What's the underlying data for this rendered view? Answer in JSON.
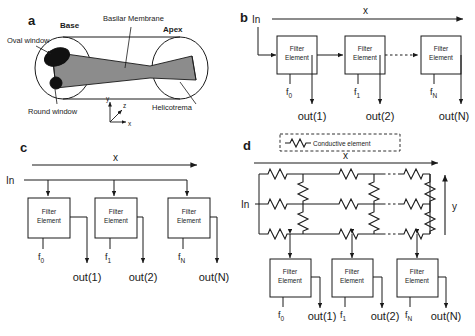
{
  "figure": {
    "panels": [
      "a",
      "b",
      "c",
      "d"
    ]
  },
  "panel_a": {
    "letter": "a",
    "labels": {
      "oval_window": "Oval window",
      "base": "Base",
      "basilar_membrane": "Basilar Membrane",
      "apex": "Apex",
      "round_window": "Round window",
      "helicotrema": "Helicotrema"
    },
    "axes": {
      "x": "x",
      "y": "y",
      "z": "z"
    }
  },
  "panel_b": {
    "letter": "b",
    "input": "In",
    "axis_label": "x",
    "filters": [
      {
        "box": [
          "Filter",
          "Element"
        ],
        "freq": "f",
        "freq_sub": "0",
        "out": "out(1)"
      },
      {
        "box": [
          "Filter",
          "Element"
        ],
        "freq": "f",
        "freq_sub": "1",
        "out": "out(2)"
      },
      {
        "box": [
          "Filter",
          "Element"
        ],
        "freq": "f",
        "freq_sub": "N",
        "out": "out(N)"
      }
    ]
  },
  "panel_c": {
    "letter": "c",
    "input": "In",
    "axis_label": "x",
    "filters": [
      {
        "box": [
          "Filter",
          "Element"
        ],
        "freq": "f",
        "freq_sub": "0",
        "out": "out(1)"
      },
      {
        "box": [
          "Filter",
          "Element"
        ],
        "freq": "f",
        "freq_sub": "1",
        "out": "out(2)"
      },
      {
        "box": [
          "Filter",
          "Element"
        ],
        "freq": "f",
        "freq_sub": "N",
        "out": "out(N)"
      }
    ]
  },
  "panel_d": {
    "letter": "d",
    "input": "In",
    "axis_label_x": "x",
    "axis_label_y": "y",
    "legend": "Conductive element",
    "filters": [
      {
        "box": [
          "Filter",
          "Element"
        ],
        "freq": "f",
        "freq_sub": "0",
        "out": "out(1)"
      },
      {
        "box": [
          "Filter",
          "Element"
        ],
        "freq": "f",
        "freq_sub": "1",
        "out": "out(2)"
      },
      {
        "box": [
          "Filter",
          "Element"
        ],
        "freq": "f",
        "freq_sub": "N",
        "out": "out(N)"
      }
    ],
    "network": {
      "rails": 3,
      "columns": 3
    }
  },
  "colors": {
    "line": "#1a1a1a",
    "membrane_fill": "#8c8c8c",
    "window_fill": "#111111",
    "background": "#ffffff"
  }
}
